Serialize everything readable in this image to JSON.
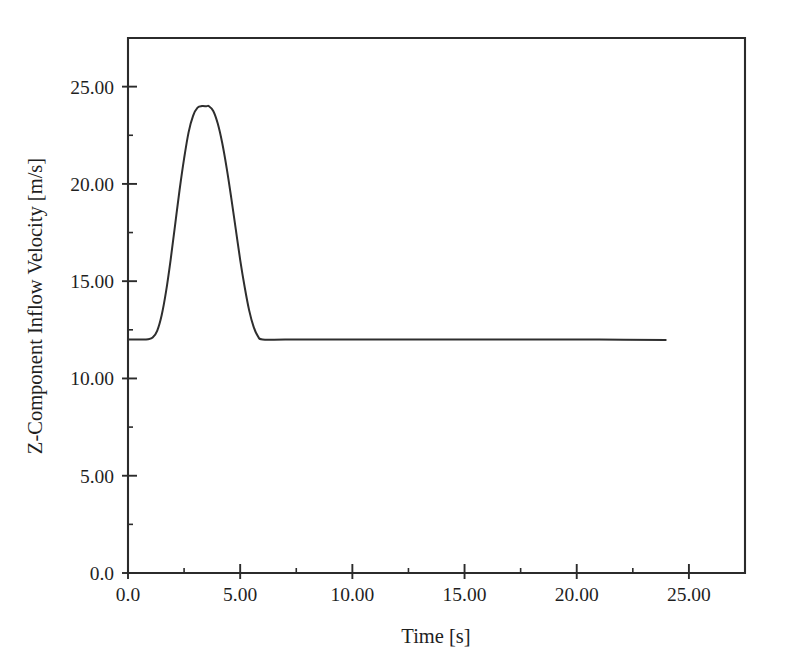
{
  "chart_data": {
    "type": "line",
    "title": "",
    "xlabel": "Time [s]",
    "ylabel": "Z-Component Inflow Velocity [m/s]",
    "xlim": [
      0.0,
      27.5
    ],
    "ylim": [
      0.0,
      27.5
    ],
    "grid": false,
    "legend": null,
    "xticks": [
      0.0,
      5.0,
      10.0,
      15.0,
      20.0,
      25.0
    ],
    "xticklabels": [
      "0.0",
      "5.00",
      "10.00",
      "15.00",
      "20.00",
      "25.00"
    ],
    "xminorticks": [
      2.5,
      7.5,
      12.5,
      17.5,
      22.5
    ],
    "yticks": [
      0.0,
      5.0,
      10.0,
      15.0,
      20.0,
      25.0
    ],
    "yticklabels": [
      "0.0",
      "5.00",
      "10.00",
      "15.00",
      "20.00",
      "25.00"
    ],
    "yminorticks": [
      2.5,
      7.5,
      12.5,
      17.5,
      22.5
    ],
    "series": [
      {
        "name": "Z-Component Inflow Velocity",
        "color": "#2e2e2e",
        "baseline_value": 12.0,
        "peak_value": 24.0,
        "peak_time": 3.6,
        "gust_start_time": 1.1,
        "gust_end_time": 5.8,
        "data_end_time": 24.0,
        "x": [
          0.0,
          0.3,
          0.6,
          0.9,
          1.1,
          1.3,
          1.5,
          1.7,
          1.9,
          2.1,
          2.3,
          2.5,
          2.7,
          2.9,
          3.1,
          3.3,
          3.5,
          3.6,
          3.8,
          4.0,
          4.2,
          4.4,
          4.6,
          4.8,
          5.0,
          5.2,
          5.4,
          5.6,
          5.8,
          6.0,
          7.0,
          9.0,
          12.0,
          15.0,
          18.0,
          21.0,
          24.0
        ],
        "y": [
          12.0,
          12.0,
          12.0,
          12.02,
          12.1,
          12.45,
          13.25,
          14.5,
          16.1,
          17.9,
          19.7,
          21.3,
          22.65,
          23.5,
          23.92,
          24.0,
          23.99,
          24.0,
          23.75,
          23.1,
          22.1,
          20.8,
          19.3,
          17.7,
          16.1,
          14.7,
          13.5,
          12.65,
          12.15,
          12.0,
          12.0,
          12.0,
          12.0,
          12.0,
          12.0,
          12.0,
          11.98
        ]
      }
    ]
  },
  "axes": {
    "frame": {
      "left_px": 128,
      "right_px": 745,
      "top_px": 38,
      "bottom_px": 573
    }
  }
}
